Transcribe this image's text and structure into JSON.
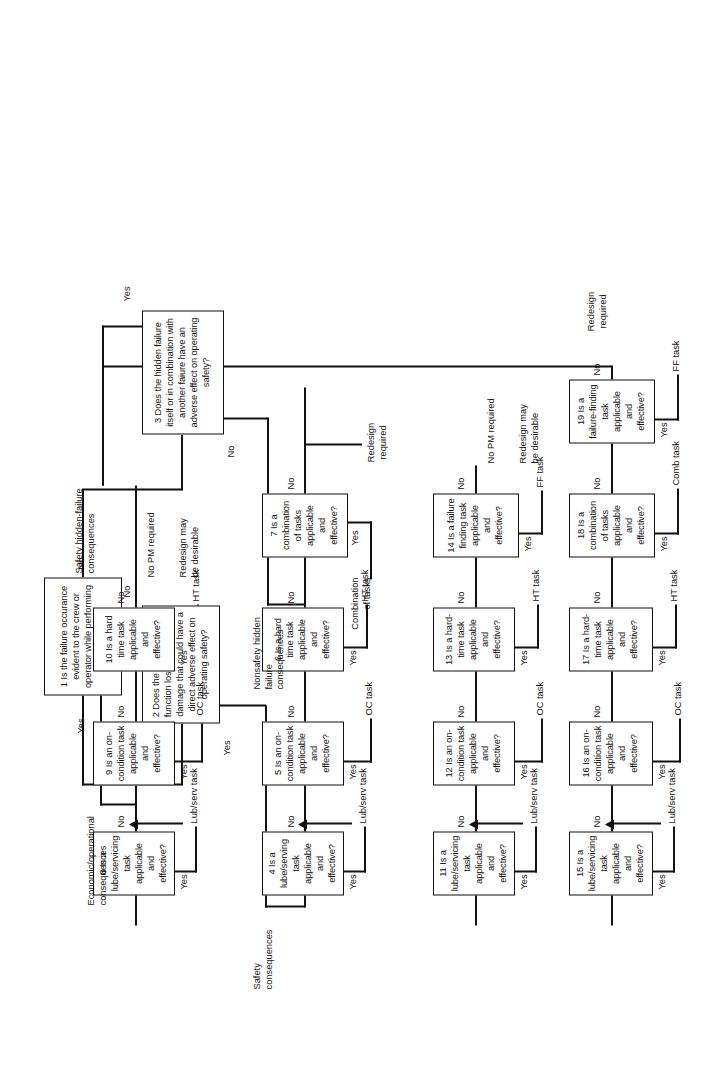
{
  "figure": {
    "type": "decision-flowchart"
  },
  "nodes": {
    "n1": "1 Is the failure occurance evident to the crew or operator while performing normal duties",
    "n2": "2 Does the failure cause a function loss or secondary damage that could have a direct adverse effect on operating safety?",
    "n3": "3 Does the hidden failure itself or in combination with another faiure have an adverse effect on operating safety?",
    "n4": "4 Is a lube/serving task applicable and effective?",
    "n5": "5 Is an on-condition task applicable and effective?",
    "n6": "6 Is a hard time task applicable and effective?",
    "n7": "7 Is a combination of tasks applicable and effective?",
    "n8": "8 Is a lube/servicing task applicable and effective?",
    "n9": "9 Is an on-condition task applicable and effective?",
    "n10": "10 Is a hard time task applicable and effective?",
    "n11": "11 Is a lube/servicing task applicable and effective?",
    "n12": "12 Is an on-condition task applicable and effective?",
    "n13": "13 Is a hard-time task applicable and effective?",
    "n14": "14 Is a failure finding task applicable and effective?",
    "n15": "15 Is a lube/servicing task applicable and effective?",
    "n16": "16 Is an on-condition task applicable and effective?",
    "n17": "17 Is a hard-time task applicable and effective?",
    "n18": "18 Is a combination of tasks applicable and effective?",
    "n19": "19 Is a failure-finding task applicable and effective?"
  },
  "branch_labels": {
    "yes": "Yes",
    "no": "No"
  },
  "category_labels": {
    "safety": "Safety\nconsequences",
    "economic": "Economic/operational\nconsequences",
    "nonsafety_hidden": "Nonsafety hidden\nfailure\nconsequences",
    "safety_hidden": "Safety hidden-failure\nconsequences"
  },
  "outcomes": {
    "lub_serv_4": "Lub/serv task",
    "oc_5": "OC task",
    "ht_6": "HT task",
    "combination_7": "Combination\nof tasks",
    "redesign_required_7": "Redesign\nrequired",
    "lub_serv_8": "Lub/serv task",
    "oc_9": "OC task",
    "ht_10": "HT task",
    "no_pm_10": "No PM required",
    "redesign_desirable_10": "Redesign may\nbe desirable",
    "lub_serv_11": "Lub/serv task",
    "oc_12": "OC task",
    "ht_13": "HT task",
    "ff_14": "FF task",
    "no_pm_14": "No PM required",
    "redesign_desirable_14": "Redesign may\nbe desirable",
    "lub_serv_15": "Lub/serv task",
    "oc_16": "OC task",
    "ht_17": "HT task",
    "comb_18": "Comb task",
    "ff_19": "FF task",
    "redesign_required_19": "Redesign\nrequired"
  },
  "edges": {
    "n1_yes": "Yes",
    "n1_no": "No",
    "n2_yes": "Yes",
    "n2_no": "No",
    "n3_yes": "Yes",
    "n3_no": "No",
    "n4_yes": "Yes",
    "n4_no": "No",
    "n5_yes": "Yes",
    "n5_no": "No",
    "n6_yes": "Yes",
    "n6_no": "No",
    "n7_yes": "Yes",
    "n7_no": "No",
    "n8_yes": "Yes",
    "n8_no": "No",
    "n9_yes": "Yes",
    "n9_no": "No",
    "n10_yes": "Yes",
    "n10_no": "No",
    "n11_yes": "Yes",
    "n11_no": "No",
    "n12_yes": "Yes",
    "n12_no": "No",
    "n13_yes": "Yes",
    "n13_no": "No",
    "n14_yes": "Yes",
    "n14_no": "No",
    "n15_yes": "Yes",
    "n15_no": "No",
    "n16_yes": "Yes",
    "n16_no": "No",
    "n17_yes": "Yes",
    "n17_no": "No",
    "n18_yes": "Yes",
    "n18_no": "No",
    "n19_yes": "Yes",
    "n19_no": "No"
  },
  "colors": {
    "ink": "#111111",
    "paper": "#ffffff"
  }
}
